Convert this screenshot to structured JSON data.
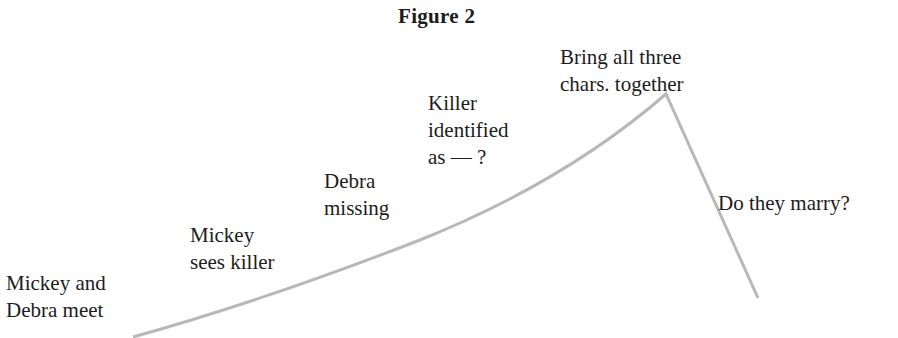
{
  "figure": {
    "title": "Figure 2",
    "line_color": "#b8b8b8",
    "labels": [
      {
        "id": "meet",
        "lines": [
          "Mickey and",
          "Debra meet"
        ]
      },
      {
        "id": "sees-killer",
        "lines": [
          "Mickey",
          "sees killer"
        ]
      },
      {
        "id": "missing",
        "lines": [
          "Debra",
          "missing"
        ]
      },
      {
        "id": "identified",
        "lines": [
          "Killer",
          "identified",
          "as  —  ?"
        ]
      },
      {
        "id": "together",
        "lines": [
          "Bring all three",
          "chars. together"
        ]
      },
      {
        "id": "marry",
        "lines": [
          "Do they marry?"
        ]
      }
    ]
  }
}
